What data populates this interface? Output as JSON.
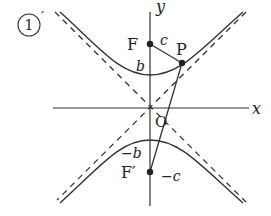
{
  "figure": {
    "label": "①′",
    "label_circle": "1",
    "label_prime": "′",
    "colors": {
      "ink": "#222222",
      "background": "#ffffff"
    }
  },
  "axes": {
    "x_label": "x",
    "y_label": "y",
    "origin_label": "O"
  },
  "points": {
    "focus_upper": {
      "label": "F"
    },
    "point_p": {
      "label": "P"
    },
    "focus_lower": {
      "label": "F′"
    }
  },
  "annotations": {
    "c_label": "c",
    "b_label": "b",
    "neg_b_label": "−b",
    "neg_c_label": "−c"
  },
  "curves": {
    "hyperbola": "vertical hyperbola with two branches (upper and lower), solid",
    "asymptotes": "two dashed lines through origin"
  }
}
